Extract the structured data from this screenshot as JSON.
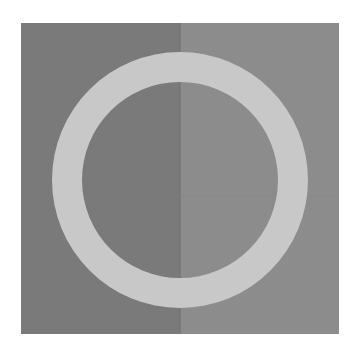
{
  "figure": {
    "canvas": {
      "width": 358,
      "height": 353,
      "background": "#ffffff"
    },
    "square": {
      "x": 21,
      "y": 23,
      "width": 318,
      "height": 311
    },
    "split_x": 180,
    "horizontal_seam_y": 196,
    "colors": {
      "left_half": "#7a7a7a",
      "right_half": "#8c8c8c",
      "split_seam": "#6e6e6e",
      "horizontal_seam": "#828282",
      "ring": "#c8c8c8"
    },
    "ring": {
      "cx": 180,
      "cy": 180,
      "outer_radius": 128,
      "inner_radius": 98
    }
  }
}
